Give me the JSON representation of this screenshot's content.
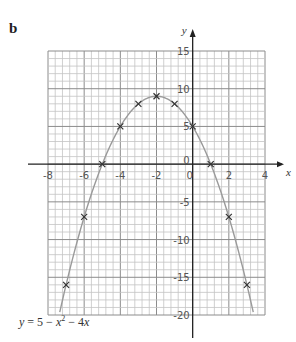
{
  "panel_label": "b",
  "equation": {
    "text": "y = 5 − x² − 4x"
  },
  "chart_data": {
    "type": "line",
    "title": "",
    "function": "y = 5 - x^2 - 4x",
    "xlabel": "x",
    "ylabel": "y",
    "xlim": [
      -8,
      4
    ],
    "ylim": [
      -20,
      15
    ],
    "grid": true,
    "x_ticks": [
      -8,
      -6,
      -4,
      -2,
      0,
      2,
      4
    ],
    "y_ticks": [
      15,
      10,
      5,
      0,
      -5,
      -10,
      -15,
      -20
    ],
    "x_tick_labels": [
      "-8",
      "-6",
      "-4",
      "-2",
      "0",
      "2",
      "4"
    ],
    "y_tick_labels": [
      "15",
      "10",
      "5",
      "0",
      "-5",
      "-10",
      "-15",
      "-20"
    ],
    "origin_label": "0",
    "points_marker": "x",
    "x": [
      -7,
      -6,
      -5,
      -4,
      -3,
      -2,
      -1,
      0,
      1,
      2,
      3
    ],
    "values": [
      -16,
      -7,
      0,
      5,
      8,
      9,
      8,
      5,
      0,
      -7,
      -16
    ],
    "annotation": "y = 5 − x² − 4x",
    "curve_color": "#9a9a9a",
    "grid_color": "#b8b8b8"
  }
}
